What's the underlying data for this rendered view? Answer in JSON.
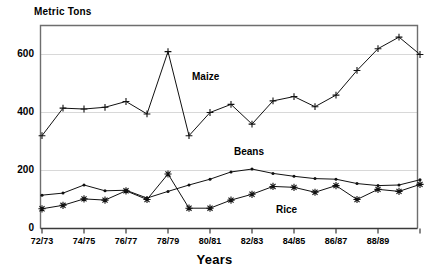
{
  "chart_data": {
    "type": "line",
    "title": "",
    "ylabel": "Metric Tons",
    "xlabel": "Years",
    "ylim": [
      0,
      700
    ],
    "yticks": [
      0,
      200,
      400,
      600
    ],
    "ytick_labels": [
      "0",
      "200",
      "400",
      "600"
    ],
    "grid": true,
    "gridlines_at": [
      200,
      400,
      600
    ],
    "legend": "inline-annotations",
    "x": [
      "72/73",
      "73/74",
      "74/75",
      "75/76",
      "76/77",
      "77/78",
      "78/79",
      "79/80",
      "80/81",
      "81/82",
      "82/83",
      "83/84",
      "84/85",
      "85/86",
      "86/87",
      "87/88",
      "88/89",
      "89/90",
      "90/91"
    ],
    "xtick_labels_shown": [
      "72/73",
      "74/75",
      "76/77",
      "78/79",
      "80/81",
      "82/83",
      "84/85",
      "86/87",
      "88/89"
    ],
    "series": [
      {
        "name": "Maize",
        "marker": "plus",
        "values": [
          320,
          415,
          412,
          418,
          438,
          395,
          610,
          320,
          400,
          428,
          360,
          440,
          455,
          420,
          460,
          545,
          620,
          660,
          600
        ]
      },
      {
        "name": "Beans",
        "marker": "dot",
        "values": [
          115,
          122,
          150,
          130,
          132,
          105,
          128,
          150,
          170,
          195,
          205,
          190,
          180,
          172,
          170,
          155,
          148,
          150,
          168
        ]
      },
      {
        "name": "Rice",
        "marker": "asterisk",
        "values": [
          68,
          80,
          102,
          98,
          130,
          100,
          188,
          70,
          70,
          98,
          118,
          145,
          142,
          125,
          148,
          100,
          135,
          128,
          152
        ]
      }
    ],
    "annotations": [
      {
        "text": "Maize",
        "x_value": "80/81",
        "y_value": 520
      },
      {
        "text": "Beans",
        "x_value": "82/83",
        "y_value": 262
      },
      {
        "text": "Rice",
        "x_value": "84/85",
        "y_value": 60
      }
    ]
  }
}
